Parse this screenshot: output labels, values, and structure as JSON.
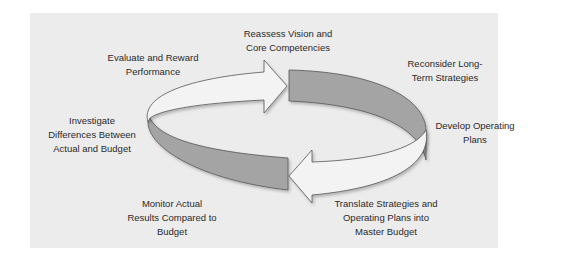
{
  "diagram": {
    "type": "cycle",
    "colors": {
      "background": "#ececec",
      "light_arrow": "#f3f3f3",
      "dark_band": "#a4a4a4",
      "outline": "#555555",
      "text": "#2a2a2a"
    },
    "steps": [
      {
        "id": "reassess",
        "label": "Reassess Vision and\nCore Competencies"
      },
      {
        "id": "reconsider",
        "label": "Reconsider Long-\nTerm Strategies"
      },
      {
        "id": "develop",
        "label": "Develop Operating\nPlans"
      },
      {
        "id": "translate",
        "label": "Translate Strategies and\nOperating Plans into\nMaster Budget"
      },
      {
        "id": "monitor",
        "label": "Monitor Actual\nResults Compared to\nBudget"
      },
      {
        "id": "investigate",
        "label": "Investigate\nDifferences Between\nActual and Budget"
      },
      {
        "id": "evaluate",
        "label": "Evaluate and Reward\nPerformance"
      }
    ]
  }
}
